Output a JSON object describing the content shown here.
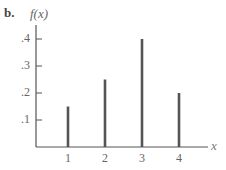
{
  "figure": {
    "part_label": "b.",
    "ylabel": "f(x)",
    "xlabel": "x"
  },
  "chart_data": {
    "type": "bar",
    "title": "",
    "subtitle": "",
    "xlabel": "x",
    "ylabel": "f(x)",
    "categories": [
      "1",
      "2",
      "3",
      "4"
    ],
    "x": [
      1,
      2,
      3,
      4
    ],
    "values": [
      0.15,
      0.25,
      0.4,
      0.2
    ],
    "y_ticks": [
      ".1",
      ".2",
      ".3",
      ".4"
    ],
    "x_ticks": [
      "1",
      "2",
      "3",
      "4"
    ],
    "ylim": [
      0,
      0.45
    ],
    "grid": false,
    "legend": null,
    "style": "spike / line-bar probability mass function",
    "bar_color": "#555555"
  }
}
